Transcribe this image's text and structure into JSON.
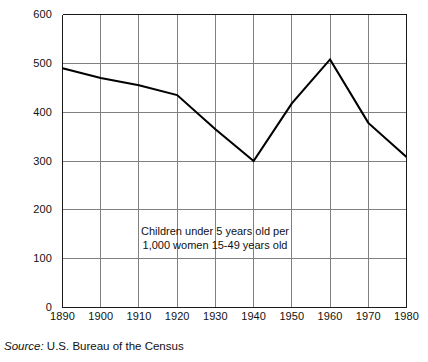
{
  "chart_data": {
    "type": "line",
    "title": "",
    "xlabel": "",
    "ylabel": "",
    "x": [
      1890,
      1900,
      1910,
      1920,
      1930,
      1940,
      1950,
      1960,
      1970,
      1980
    ],
    "values": [
      490,
      470,
      455,
      435,
      365,
      300,
      418,
      508,
      378,
      308
    ],
    "series": [
      {
        "name": "Children under 5 years old per 1,000 women 15-49 years old",
        "values": [
          490,
          470,
          455,
          435,
          365,
          300,
          418,
          508,
          378,
          308
        ]
      }
    ],
    "xlim": [
      1890,
      1980
    ],
    "ylim": [
      0,
      600
    ],
    "xticks": [
      "1890",
      "1900",
      "1910",
      "1920",
      "1930",
      "1940",
      "1950",
      "1960",
      "1970",
      "1980"
    ],
    "yticks": [
      "0",
      "100",
      "200",
      "300",
      "400",
      "500",
      "600"
    ],
    "grid": "both",
    "legend": "none",
    "annotations": [
      "Children under 5 years old per",
      "1,000 women 15-49 years old"
    ],
    "line_color": "#000000",
    "grid_color": "#808080",
    "axis_color": "#1a1a1a"
  },
  "source": {
    "label": "Source:",
    "text": "U.S. Bureau of the Census"
  }
}
